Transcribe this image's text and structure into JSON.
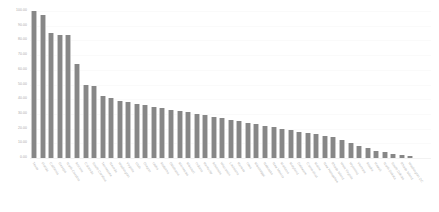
{
  "chart_data": {
    "type": "bar",
    "title": "",
    "xlabel": "",
    "ylabel": "",
    "ylim": [
      0,
      100
    ],
    "grid": true,
    "legend": null,
    "bar_color": "#878787",
    "y_ticks": [
      "0.00",
      "10.00",
      "20.00",
      "30.00",
      "40.00",
      "50.00",
      "60.00",
      "70.00",
      "80.00",
      "90.00",
      "100.00"
    ],
    "categories": [
      "Texas",
      "Florida",
      "California",
      "Georgia",
      "North Carolina",
      "Arizona",
      "Colorado",
      "South Carolina",
      "Tennessee",
      "Nevada",
      "Washington",
      "Virginia",
      "Utah",
      "Oregon",
      "Idaho",
      "Alabama",
      "Oklahoma",
      "Minnesota",
      "Missouri",
      "Indiana",
      "Kentucky",
      "Arkansas",
      "Wisconsin",
      "Louisiana",
      "Kansas",
      "Iowa",
      "Mississippi",
      "Nebraska",
      "New Mexico",
      "Montana",
      "Maryland",
      "Delaware",
      "Connecticut",
      "Maine",
      "New Hampshire",
      "Rhode Island",
      "West Virginia",
      "Wyoming",
      "Vermont",
      "Alaska",
      "Hawaii",
      "North Dakota",
      "South Dakota",
      "Rhode Island",
      "Washington DC"
    ],
    "values": [
      100.0,
      97.5,
      85.0,
      84.0,
      83.5,
      64.0,
      50.0,
      49.0,
      42.0,
      41.0,
      39.0,
      38.0,
      37.0,
      36.0,
      35.0,
      34.0,
      33.0,
      32.0,
      31.0,
      30.0,
      29.0,
      28.0,
      27.0,
      26.0,
      25.0,
      24.0,
      23.0,
      22.0,
      21.0,
      20.0,
      19.0,
      18.0,
      17.0,
      16.0,
      15.0,
      14.0,
      12.0,
      10.0,
      8.0,
      6.5,
      5.0,
      4.0,
      3.0,
      2.0,
      1.5
    ]
  }
}
